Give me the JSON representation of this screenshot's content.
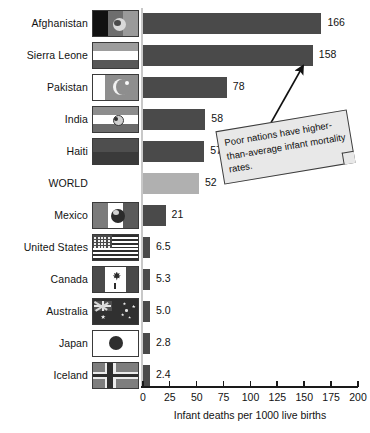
{
  "chart_data": {
    "type": "bar",
    "orientation": "horizontal",
    "title": "",
    "xlabel": "Infant deaths per 1000 live births",
    "ylabel": "",
    "xlim": [
      0,
      200
    ],
    "xticks": [
      0,
      25,
      50,
      75,
      100,
      125,
      150,
      175,
      200
    ],
    "grid": false,
    "legend": "none",
    "categories": [
      "Afghanistan",
      "Sierra Leone",
      "Pakistan",
      "India",
      "Haiti",
      "WORLD",
      "Mexico",
      "United States",
      "Canada",
      "Australia",
      "Japan",
      "Iceland"
    ],
    "values": [
      166,
      158,
      78,
      58,
      57,
      52,
      21,
      6.5,
      5.3,
      5.0,
      2.8,
      2.4
    ],
    "value_labels": [
      "166",
      "158",
      "78",
      "58",
      "57",
      "52",
      "21",
      "6.5",
      "5.3",
      "5.0",
      "2.8",
      "2.4"
    ],
    "series": [
      {
        "name": "Infant mortality rate",
        "values": [
          166,
          158,
          78,
          58,
          57,
          52,
          21,
          6.5,
          5.3,
          5.0,
          2.8,
          2.4
        ]
      }
    ],
    "highlight_category": "WORLD",
    "colors": {
      "bar": "#4a4a4a",
      "highlight_bar": "#b0b0b0",
      "axis": "#1a1a1a",
      "baseline": "#c8c8c8",
      "text": "#121212",
      "callout_fill": "#e8e8e8",
      "callout_border": "#3c3c3c"
    }
  },
  "rows": [
    {
      "label": "Afghanistan",
      "value_label": "166",
      "value": 166,
      "flag": "flag-afghanistan",
      "highlight": false
    },
    {
      "label": "Sierra Leone",
      "value_label": "158",
      "value": 158,
      "flag": "flag-sierra-leone",
      "highlight": false
    },
    {
      "label": "Pakistan",
      "value_label": "78",
      "value": 78,
      "flag": "flag-pakistan",
      "highlight": false
    },
    {
      "label": "India",
      "value_label": "58",
      "value": 58,
      "flag": "flag-india",
      "highlight": false
    },
    {
      "label": "Haiti",
      "value_label": "57",
      "value": 57,
      "flag": "flag-haiti",
      "highlight": false
    },
    {
      "label": "WORLD",
      "value_label": "52",
      "value": 52,
      "flag": "none",
      "highlight": true
    },
    {
      "label": "Mexico",
      "value_label": "21",
      "value": 21,
      "flag": "flag-mexico",
      "highlight": false
    },
    {
      "label": "United States",
      "value_label": "6.5",
      "value": 6.5,
      "flag": "flag-united-states",
      "highlight": false
    },
    {
      "label": "Canada",
      "value_label": "5.3",
      "value": 5.3,
      "flag": "flag-canada",
      "highlight": false
    },
    {
      "label": "Australia",
      "value_label": "5.0",
      "value": 5.0,
      "flag": "flag-australia",
      "highlight": false
    },
    {
      "label": "Japan",
      "value_label": "2.8",
      "value": 2.8,
      "flag": "flag-japan",
      "highlight": false
    },
    {
      "label": "Iceland",
      "value_label": "2.4",
      "value": 2.4,
      "flag": "flag-iceland",
      "highlight": false
    }
  ],
  "axis": {
    "ticks": [
      "0",
      "25",
      "50",
      "75",
      "100",
      "125",
      "150",
      "175",
      "200"
    ],
    "title": "Infant deaths per 1000 live births"
  },
  "callout": {
    "text": "Poor nations have higher-than-average infant mortality rates.",
    "arrow": "arrow-up-right-icon"
  }
}
